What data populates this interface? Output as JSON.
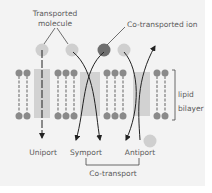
{
  "diagram": {
    "labels": {
      "transported_molecule_line1": "Transported",
      "transported_molecule_line2": "molecule",
      "co_transported_ion": "Co-transported ion",
      "lipid_bilayer_line1": "lipid",
      "lipid_bilayer_line2": "bilayer",
      "uniport": "Uniport",
      "symport": "Symport",
      "antiport": "Antiport",
      "co_transport": "Co-transport"
    },
    "colors": {
      "background": "#f3f3f3",
      "lipid_head": "#8a8a8a",
      "lipid_tail": "#9a9a9a",
      "protein_channel": "#d2d2d2",
      "transported_molecule": "#cfcfcf",
      "co_transported_ion": "#6e6e6e",
      "arrow": "#222222",
      "text": "#5a5a5a"
    },
    "transport_types": [
      "Uniport",
      "Symport",
      "Antiport"
    ]
  }
}
